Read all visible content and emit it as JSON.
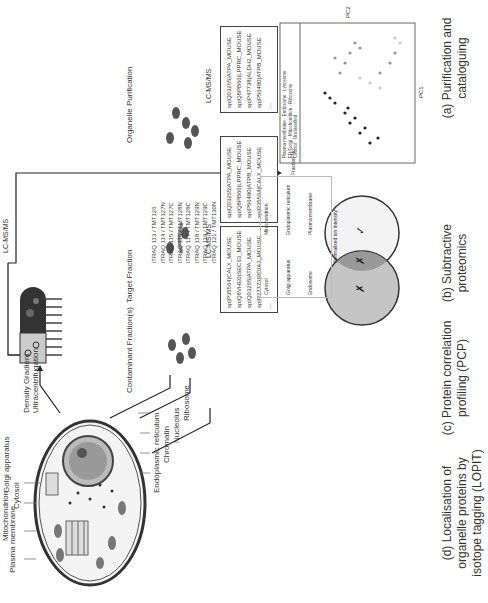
{
  "cell": {
    "labels_top": [
      "Plasma membrane",
      "Mitochondrion",
      "Cytosol",
      "Golgi apparatus"
    ],
    "labels_bottom": [
      "Endoplasmic reticulum",
      "Chromatin",
      "Nucleolus",
      "Ribosome"
    ]
  },
  "steps": {
    "organelle_purification": "Organelle Purification",
    "target_fraction": "Target Fraction",
    "contaminant_fraction": "Contaminant Fraction(s)",
    "density_gradient": "Density Gradient Ultracentrifugation",
    "lcms": "LC-MS/MS"
  },
  "panel_a": {
    "proteins": [
      "sp|Q03265|ATPA_MOUSE",
      "sp|Q8PB66|LPPRC_MOUSE",
      "sp|P47738|ALDH2_MOUSE",
      "sp|P56480|ATPB_MOUSE",
      "..."
    ],
    "caption": "(a) Purification and cataloguing"
  },
  "panel_b": {
    "target_proteins": [
      "sp|Q03265|ATPA_MOUSE",
      "sp|Q8PB66|LPPRC_MOUSE",
      "sp|P56480|ATPB_MOUSE",
      "sp|P35564|CALX_MOUSE",
      "..."
    ],
    "contaminant_proteins": [
      "sp|P35564|CALX_MOUSE",
      "sp|Q8VHE0|SEC63_MOUSE",
      "sp|Q03265|ATPA_MOUSE",
      "sp|P27773|PDIA3_MOUSE",
      "..."
    ],
    "venn": {
      "target_mark": "✓",
      "overlap_mark": "✗",
      "contaminant_mark": "✗"
    },
    "caption": "(b) Subtractive proteomics"
  },
  "panel_c": {
    "tags": [
      "iTRAQ 113 / TMT126",
      "iTRAQ 114 / TMT127N",
      "iTRAQ 115 / TMT127C",
      "iTRAQ 116 / TMT128N",
      "iTRAQ 117 / TMT128C",
      "iTRAQ 118 / TMT129N",
      "iTRAQ 119 / TMT129C",
      "iTRAQ 121 / TMT130N"
    ],
    "profiles": [
      "Cytosol",
      "Mitochondrion",
      "Golgi apparatus",
      "Endoplasmic reticulum",
      "Endosome",
      "Plasma membrane"
    ],
    "ylabel": "Normalised ion intensity",
    "xlabel": "Fraction No.",
    "caption": "(c) Protein correlation profiling (PCP)"
  },
  "panel_d": {
    "legend": [
      "Plasma membrane",
      "Endosome",
      "Lysosome",
      "ER/Golgi",
      "Mitochondrion",
      "Ribosome",
      "Cytosol",
      "Unclassified"
    ],
    "xlabel": "PC1",
    "ylabel": "PC2",
    "caption": "(d) Localisation of organelle proteins by isotope tagging (LOPIT)"
  }
}
